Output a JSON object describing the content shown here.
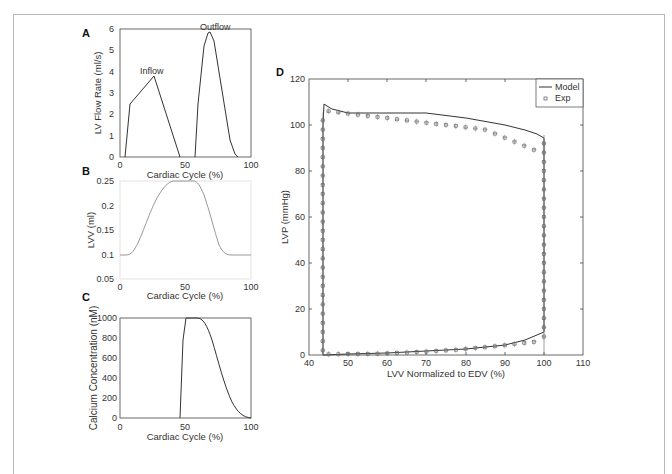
{
  "figure": {
    "panels": {
      "A": {
        "label": "A",
        "ylabel": "LV Flow Rate (ml/s)",
        "xlabel": "Cardiac Cycle (%)",
        "annotations": {
          "inflow": "Inflow",
          "outflow": "Outflow"
        },
        "xticks": [
          "0",
          "50",
          "100"
        ],
        "yticks": [
          "0",
          "1",
          "2",
          "3",
          "4",
          "5",
          "6"
        ]
      },
      "B": {
        "label": "B",
        "ylabel": "LVV (ml)",
        "xlabel": "Cardiac Cycle (%)",
        "xticks": [
          "0",
          "50",
          "100"
        ],
        "yticks": [
          "0.05",
          "0.1",
          "0.15",
          "0.2",
          "0.25"
        ]
      },
      "C": {
        "label": "C",
        "ylabel": "Calcium Concentration (nM)",
        "xlabel": "Cardiac Cycle (%)",
        "xticks": [
          "0",
          "50",
          "100"
        ],
        "yticks": [
          "0",
          "200",
          "400",
          "600",
          "800",
          "1000"
        ]
      },
      "D": {
        "label": "D",
        "ylabel": "LVP (mmHg)",
        "xlabel": "LVV Normalized to EDV (%)",
        "xticks": [
          "40",
          "50",
          "60",
          "70",
          "80",
          "90",
          "100",
          "110"
        ],
        "yticks": [
          "0",
          "20",
          "40",
          "60",
          "80",
          "100",
          "120"
        ],
        "legend": {
          "model": "Model",
          "exp": "Exp"
        }
      }
    }
  },
  "chart_data": [
    {
      "type": "line",
      "panel": "A",
      "title": "",
      "xlabel": "Cardiac Cycle (%)",
      "ylabel": "LV Flow Rate (ml/s)",
      "xlim": [
        0,
        100
      ],
      "ylim": [
        0,
        6
      ],
      "annotations": [
        "Inflow",
        "Outflow"
      ],
      "series": [
        {
          "name": "Inflow",
          "x": [
            4,
            8,
            26,
            46
          ],
          "values": [
            0,
            2.5,
            3.8,
            0
          ]
        },
        {
          "name": "Outflow",
          "x": [
            58,
            60,
            64,
            67,
            69,
            72,
            76,
            80,
            84,
            88,
            90
          ],
          "values": [
            0,
            2.5,
            5.2,
            5.8,
            5.85,
            5.4,
            4.0,
            2.2,
            0.8,
            0.15,
            0
          ]
        }
      ]
    },
    {
      "type": "line",
      "panel": "B",
      "title": "",
      "xlabel": "Cardiac Cycle (%)",
      "ylabel": "LVV (ml)",
      "xlim": [
        0,
        100
      ],
      "ylim": [
        0.05,
        0.25
      ],
      "series": [
        {
          "name": "LVV",
          "x": [
            0,
            5,
            10,
            20,
            30,
            40,
            45,
            55,
            60,
            65,
            70,
            75,
            80,
            90,
            100
          ],
          "values": [
            0.1,
            0.1,
            0.11,
            0.16,
            0.21,
            0.245,
            0.25,
            0.25,
            0.24,
            0.19,
            0.14,
            0.11,
            0.1,
            0.1,
            0.1
          ]
        }
      ]
    },
    {
      "type": "line",
      "panel": "C",
      "title": "",
      "xlabel": "Cardiac Cycle (%)",
      "ylabel": "Calcium Concentration (nM)",
      "xlim": [
        0,
        100
      ],
      "ylim": [
        0,
        1000
      ],
      "series": [
        {
          "name": "Calcium",
          "x": [
            0,
            46,
            48,
            51,
            55,
            60,
            65,
            70,
            75,
            80,
            85,
            90,
            95,
            100
          ],
          "values": [
            0,
            0,
            600,
            1000,
            1000,
            990,
            930,
            800,
            620,
            420,
            230,
            90,
            20,
            0
          ]
        }
      ]
    },
    {
      "type": "line",
      "panel": "D",
      "title": "",
      "xlabel": "LVV Normalized to EDV (%)",
      "ylabel": "LVP (mmHg)",
      "xlim": [
        40,
        110
      ],
      "ylim": [
        0,
        120
      ],
      "legend_position": "upper right",
      "series": [
        {
          "name": "Model",
          "x": [
            43.5,
            43.5,
            44,
            45,
            50,
            60,
            70,
            80,
            90,
            95,
            98,
            100,
            100,
            100,
            95,
            90,
            80,
            70,
            60,
            50,
            44,
            43.5
          ],
          "values": [
            0,
            100,
            109,
            107,
            105,
            105,
            105,
            103,
            100,
            98,
            96,
            94,
            50,
            10,
            6,
            4.5,
            3,
            2,
            1.2,
            0.6,
            0.2,
            0
          ]
        },
        {
          "name": "Exp",
          "x": [
            43.5,
            44,
            50,
            60,
            70,
            80,
            90,
            95,
            100,
            100,
            100,
            90,
            80,
            70,
            60,
            50,
            43.5
          ],
          "values": [
            105,
            108,
            106,
            106,
            105,
            103,
            100,
            97,
            93,
            50,
            8,
            3.5,
            2.5,
            1.5,
            1,
            0.5,
            0
          ]
        }
      ]
    }
  ]
}
